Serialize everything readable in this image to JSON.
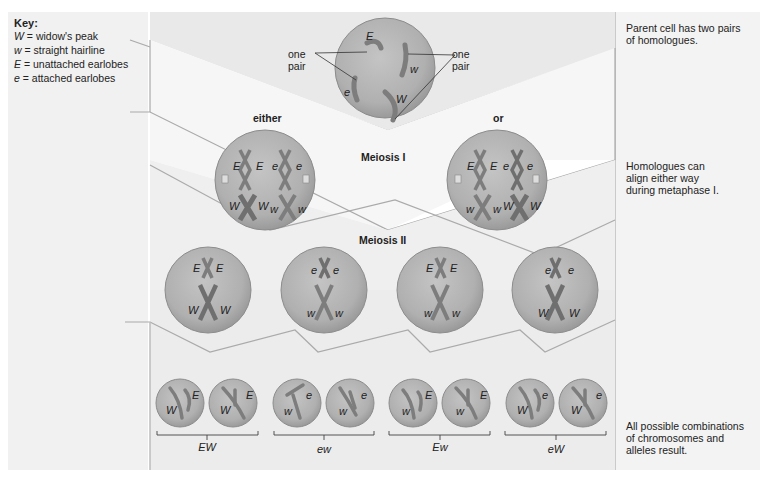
{
  "key": {
    "title": "Key:",
    "entries": [
      {
        "symbol": "W",
        "meaning": "= widow's peak"
      },
      {
        "symbol": "w",
        "meaning": "= straight hairline"
      },
      {
        "symbol": "E",
        "meaning": "= unattached earlobes"
      },
      {
        "symbol": "e",
        "meaning": "= attached earlobes"
      }
    ]
  },
  "notes": {
    "parent": "Parent cell has two pairs\nof homologues.",
    "metaphase": "Homologues can\nalign either way\nduring metaphase I.",
    "result": "All possible combinations\nof chromosomes and\nalleles result."
  },
  "parent_cell": {
    "pair_label_left": "one\npair",
    "pair_label_right": "one\npair",
    "alleles": [
      "E",
      "e",
      "w",
      "W"
    ]
  },
  "stages": {
    "meiosis1": "Meiosis I",
    "meiosis2": "Meiosis II",
    "either": "either",
    "or": "or"
  },
  "meiosis1_cells": [
    {
      "top": [
        "E",
        "E",
        "e",
        "e"
      ],
      "bottom": [
        "W",
        "W",
        "w",
        "w"
      ]
    },
    {
      "top": [
        "E",
        "E",
        "e",
        "e"
      ],
      "bottom": [
        "w",
        "w",
        "W",
        "W"
      ]
    }
  ],
  "meiosis2_cells": [
    {
      "top": [
        "E",
        "E"
      ],
      "bottom": [
        "W",
        "W"
      ]
    },
    {
      "top": [
        "e",
        "e"
      ],
      "bottom": [
        "w",
        "w"
      ]
    },
    {
      "top": [
        "E",
        "E"
      ],
      "bottom": [
        "w",
        "w"
      ]
    },
    {
      "top": [
        "e",
        "e"
      ],
      "bottom": [
        "W",
        "W"
      ]
    }
  ],
  "gametes": [
    {
      "label": "EW",
      "cells": [
        [
          "W",
          "E"
        ],
        [
          "W",
          "E"
        ]
      ]
    },
    {
      "label": "ew",
      "cells": [
        [
          "w",
          "e"
        ],
        [
          "w",
          "e"
        ]
      ]
    },
    {
      "label": "Ew",
      "cells": [
        [
          "w",
          "E"
        ],
        [
          "w",
          "E"
        ]
      ]
    },
    {
      "label": "eW",
      "cells": [
        [
          "W",
          "e"
        ],
        [
          "W",
          "e"
        ]
      ]
    }
  ],
  "colors": {
    "panel": "#efefef",
    "panel_edge": "#bdbdbd",
    "cell_fill": "#b3b3b3",
    "cell_edge": "#8c8c8c",
    "chromosome": "#7d7d7d",
    "centromere": "#ffffff"
  }
}
